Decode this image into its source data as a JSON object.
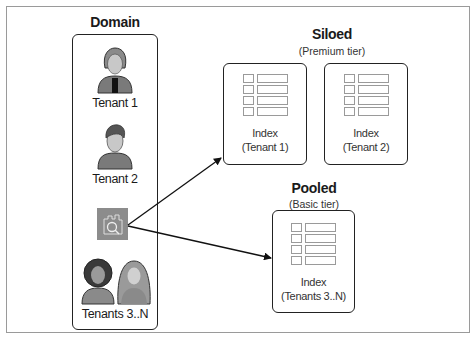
{
  "domain": {
    "title": "Domain",
    "tenants": [
      {
        "label": "Tenant 1",
        "icon": "woman-avatar-icon"
      },
      {
        "label": "Tenant 2",
        "icon": "man-avatar-icon"
      },
      {
        "label": "Tenants 3..N",
        "icon": "group-avatar-icon"
      }
    ],
    "service_icon": "search-service-icon"
  },
  "siloed": {
    "title": "Siloed",
    "subtitle": "(Premium tier)",
    "indexes": [
      {
        "line1": "Index",
        "line2": "(Tenant 1)"
      },
      {
        "line1": "Index",
        "line2": "(Tenant 2)"
      }
    ]
  },
  "pooled": {
    "title": "Pooled",
    "subtitle": "(Basic tier)",
    "index": {
      "line1": "Index",
      "line2": "(Tenants 3..N)"
    }
  },
  "colors": {
    "border": "#222222",
    "avatar_gray": "#7a7a7a",
    "service_icon_bg": "#8c8c8c"
  }
}
